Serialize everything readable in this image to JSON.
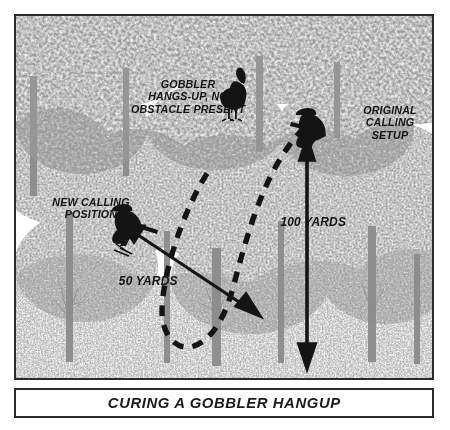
{
  "figure": {
    "title": "CURING A GOBBLER HANGUP",
    "palette": {
      "ink": "#1b1b1b",
      "foliage": "#9a9a9a",
      "foliage_dark": "#7d7d7d",
      "trunk": "#8d8d8d",
      "paper": "#ffffff",
      "silhouette": "#1a1a1a"
    }
  },
  "annotations": {
    "gobbler": "GOBBLER\nHANGS-UP, NO\nOBSTACLE PRESENT",
    "original_setup": "ORIGINAL\nCALLING\nSETUP",
    "new_position": "NEW CALLING\nPOSITION",
    "distance_long": "100 YARDS",
    "distance_short": "50 YARDS"
  },
  "actors": {
    "turkey": "gobbler-silhouette",
    "hunter_original": "seated-hunter-silhouette",
    "hunter_new": "seated-hunter-silhouette"
  },
  "caption": {
    "text": "CURING A GOBBLER HANGUP"
  }
}
